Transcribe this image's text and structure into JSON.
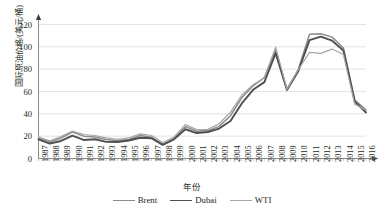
{
  "chart_data": {
    "type": "line",
    "title": "",
    "xlabel": "年份",
    "ylabel": "国际原油价格/(美元/桶)",
    "ylim": [
      0,
      120
    ],
    "yticks": [
      0,
      20,
      40,
      60,
      80,
      100,
      120
    ],
    "grid": true,
    "legend_position": "bottom",
    "categories": [
      "1987",
      "1988",
      "1989",
      "1990",
      "1991",
      "1992",
      "1993",
      "1994",
      "1995",
      "1996",
      "1997",
      "1998",
      "1999",
      "2000",
      "2001",
      "2002",
      "2003",
      "2004",
      "2005",
      "2006",
      "2007",
      "2008",
      "2009",
      "2010",
      "2011",
      "2012",
      "2013",
      "2014",
      "2015",
      "2016"
    ],
    "series": [
      {
        "name": "Brent",
        "color": "#8c8c8c",
        "values": [
          18.4,
          14.9,
          18.2,
          23.7,
          20.0,
          19.3,
          17.0,
          15.8,
          17.0,
          20.6,
          19.1,
          12.7,
          17.8,
          28.5,
          24.4,
          25.0,
          28.8,
          38.3,
          54.4,
          65.1,
          72.4,
          97.3,
          61.7,
          79.5,
          111.3,
          111.7,
          108.7,
          99.0,
          52.4,
          43.7
        ],
        "linewidth": 1.5
      },
      {
        "name": "Dubai",
        "color": "#4f4f4f",
        "values": [
          17.2,
          13.4,
          15.7,
          20.5,
          16.6,
          17.2,
          14.9,
          14.8,
          16.1,
          18.6,
          18.1,
          12.2,
          17.2,
          26.2,
          22.8,
          23.7,
          26.8,
          33.6,
          49.3,
          61.5,
          68.4,
          94.3,
          61.4,
          78.1,
          106.0,
          109.1,
          105.5,
          96.7,
          51.2,
          41.2
        ],
        "linewidth": 1.9
      },
      {
        "name": "WTI",
        "color": "#a6a6a6",
        "values": [
          19.2,
          15.9,
          19.6,
          24.5,
          21.5,
          20.6,
          18.5,
          17.2,
          18.4,
          22.0,
          20.6,
          14.4,
          19.3,
          30.3,
          25.9,
          26.1,
          31.1,
          41.5,
          56.6,
          66.1,
          72.3,
          99.7,
          62.0,
          79.5,
          95.1,
          94.1,
          98.0,
          93.2,
          48.7,
          43.2
        ],
        "linewidth": 1.2
      }
    ]
  },
  "axis": {
    "y_arrow": "up-arrow-icon",
    "x_arrow": "right-arrow-icon"
  }
}
